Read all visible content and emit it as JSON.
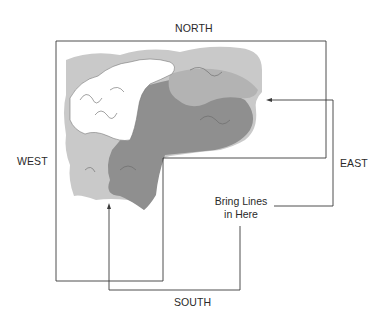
{
  "labels": {
    "north": "NORTH",
    "south": "SOUTH",
    "east": "EAST",
    "west": "WEST"
  },
  "note": {
    "line1": "Bring Lines",
    "line2": "in Here"
  },
  "colors": {
    "line": "#3a3a3a",
    "map_light": "#c9c9c9",
    "map_mid": "#b3b3b3",
    "map_dark": "#8f8f8f",
    "map_white": "#ffffff"
  }
}
